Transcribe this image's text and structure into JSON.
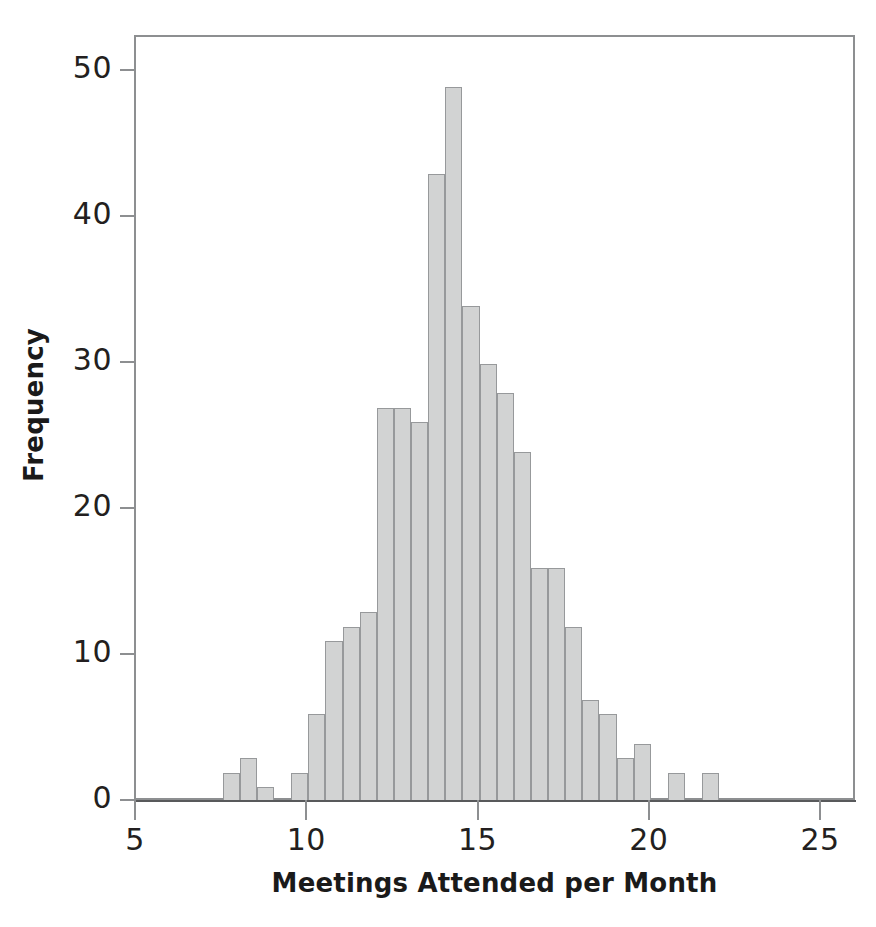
{
  "chart_data": {
    "type": "bar",
    "chart_subtype": "histogram",
    "title": "",
    "xlabel": "Meetings Attended per Month",
    "ylabel": "Frequency",
    "xlim": [
      5,
      26
    ],
    "ylim": [
      0,
      53
    ],
    "grid": false,
    "legend": "none",
    "bin_width": 0.5,
    "bar_fill_color": "#d2d3d3",
    "bar_edge_color": "#97999b",
    "axis_color": "#8d8f91",
    "text_color": "#231f20",
    "x_ticks": [
      5,
      10,
      15,
      20,
      25
    ],
    "x_tick_labels": [
      "5",
      "10",
      "15",
      "20",
      "25"
    ],
    "y_ticks": [
      0,
      10,
      20,
      30,
      40,
      50
    ],
    "y_tick_labels": [
      "0",
      "10",
      "20",
      "30",
      "40",
      "50"
    ],
    "bins": [
      {
        "left": 7.5,
        "right": 8.0,
        "value": 2
      },
      {
        "left": 8.0,
        "right": 8.5,
        "value": 3
      },
      {
        "left": 8.5,
        "right": 9.0,
        "value": 1
      },
      {
        "left": 9.0,
        "right": 9.5,
        "value": 0
      },
      {
        "left": 9.5,
        "right": 10.0,
        "value": 2
      },
      {
        "left": 10.0,
        "right": 10.5,
        "value": 6
      },
      {
        "left": 10.5,
        "right": 11.0,
        "value": 11
      },
      {
        "left": 11.0,
        "right": 11.5,
        "value": 12
      },
      {
        "left": 11.5,
        "right": 12.0,
        "value": 13
      },
      {
        "left": 12.0,
        "right": 12.5,
        "value": 27
      },
      {
        "left": 12.5,
        "right": 13.0,
        "value": 27
      },
      {
        "left": 13.0,
        "right": 13.5,
        "value": 26
      },
      {
        "left": 13.5,
        "right": 14.0,
        "value": 43
      },
      {
        "left": 14.0,
        "right": 14.5,
        "value": 49
      },
      {
        "left": 14.5,
        "right": 15.0,
        "value": 34
      },
      {
        "left": 15.0,
        "right": 15.5,
        "value": 30
      },
      {
        "left": 15.5,
        "right": 16.0,
        "value": 28
      },
      {
        "left": 16.0,
        "right": 16.5,
        "value": 24
      },
      {
        "left": 16.5,
        "right": 17.0,
        "value": 16
      },
      {
        "left": 17.0,
        "right": 17.5,
        "value": 16
      },
      {
        "left": 17.5,
        "right": 18.0,
        "value": 12
      },
      {
        "left": 18.0,
        "right": 18.5,
        "value": 7
      },
      {
        "left": 18.5,
        "right": 19.0,
        "value": 6
      },
      {
        "left": 19.0,
        "right": 19.5,
        "value": 3
      },
      {
        "left": 19.5,
        "right": 20.0,
        "value": 4
      },
      {
        "left": 20.0,
        "right": 20.5,
        "value": 0
      },
      {
        "left": 20.5,
        "right": 21.0,
        "value": 2
      },
      {
        "left": 21.0,
        "right": 21.5,
        "value": 0
      },
      {
        "left": 21.5,
        "right": 22.0,
        "value": 2
      }
    ],
    "categories": [
      "7.5-8.0",
      "8.0-8.5",
      "8.5-9.0",
      "9.0-9.5",
      "9.5-10.0",
      "10.0-10.5",
      "10.5-11.0",
      "11.0-11.5",
      "11.5-12.0",
      "12.0-12.5",
      "12.5-13.0",
      "13.0-13.5",
      "13.5-14.0",
      "14.0-14.5",
      "14.5-15.0",
      "15.0-15.5",
      "15.5-16.0",
      "16.0-16.5",
      "16.5-17.0",
      "17.0-17.5",
      "17.5-18.0",
      "18.0-18.5",
      "18.5-19.0",
      "19.0-19.5",
      "19.5-20.0",
      "20.0-20.5",
      "20.5-21.0",
      "21.0-21.5",
      "21.5-22.0"
    ],
    "values": [
      2,
      3,
      1,
      0,
      2,
      6,
      11,
      12,
      13,
      27,
      27,
      26,
      43,
      49,
      34,
      30,
      28,
      24,
      16,
      16,
      12,
      7,
      6,
      3,
      4,
      0,
      2,
      0,
      2
    ]
  },
  "axis": {
    "x_title": "Meetings Attended per Month",
    "y_title": "Frequency"
  }
}
